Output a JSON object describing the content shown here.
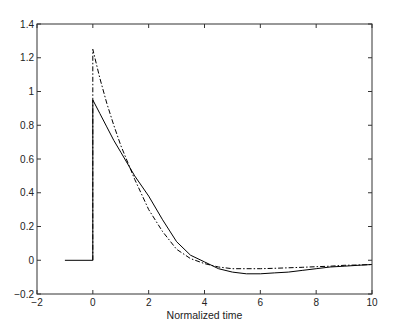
{
  "chart_data": {
    "type": "line",
    "title": "",
    "xlabel": "Normalized time",
    "ylabel": "",
    "xlim": [
      -2,
      10
    ],
    "ylim": [
      -0.2,
      1.4
    ],
    "grid": false,
    "legend": null,
    "xticks": [
      -2,
      0,
      2,
      4,
      6,
      8,
      10
    ],
    "xtick_labels": [
      "−2",
      "0",
      "2",
      "4",
      "6",
      "8",
      "10"
    ],
    "yticks": [
      -0.2,
      0,
      0.2,
      0.4,
      0.6,
      0.8,
      1,
      1.2,
      1.4
    ],
    "ytick_labels": [
      "−0.2",
      "0",
      "0.2",
      "0.4",
      "0.6",
      "0.8",
      "1",
      "1.2",
      "1.4"
    ],
    "series": [
      {
        "name": "solid",
        "style": "solid",
        "color": "#000000",
        "x": [
          -1,
          0,
          0,
          0.25,
          0.5,
          0.75,
          1,
          1.5,
          2,
          2.5,
          3,
          3.5,
          4,
          4.5,
          5,
          5.5,
          6,
          6.5,
          7,
          7.5,
          8,
          8.5,
          9,
          9.5,
          10
        ],
        "y": [
          0,
          0,
          0.95,
          0.87,
          0.79,
          0.71,
          0.64,
          0.5,
          0.38,
          0.24,
          0.11,
          0.03,
          -0.01,
          -0.05,
          -0.07,
          -0.08,
          -0.08,
          -0.075,
          -0.07,
          -0.06,
          -0.05,
          -0.04,
          -0.035,
          -0.03,
          -0.025
        ]
      },
      {
        "name": "dash-dot",
        "style": "dashdot",
        "color": "#000000",
        "x": [
          0,
          0,
          0.25,
          0.5,
          0.75,
          1,
          1.5,
          2,
          2.5,
          3,
          3.5,
          4,
          4.5,
          5,
          5.5,
          6,
          6.5,
          7,
          7.5,
          8,
          8.5,
          9,
          9.5,
          10
        ],
        "y": [
          0,
          1.25,
          1.08,
          0.93,
          0.8,
          0.68,
          0.48,
          0.3,
          0.17,
          0.065,
          0.01,
          -0.02,
          -0.04,
          -0.05,
          -0.05,
          -0.05,
          -0.048,
          -0.045,
          -0.042,
          -0.038,
          -0.035,
          -0.03,
          -0.028,
          -0.025
        ]
      }
    ]
  }
}
